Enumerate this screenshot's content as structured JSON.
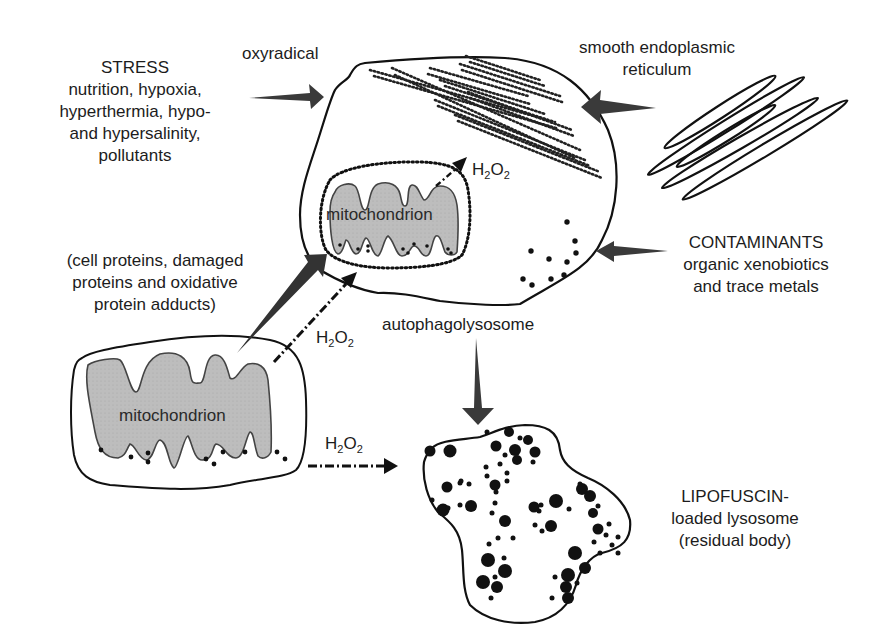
{
  "labels": {
    "stress": {
      "title": "STRESS",
      "lines": [
        "nutrition, hypoxia,",
        "hyperthermia, hypo-",
        "and hypersalinity,",
        "pollutants"
      ]
    },
    "oxyradical": "oxyradical",
    "ser": {
      "lines": [
        "smooth endoplasmic",
        "reticulum"
      ]
    },
    "contaminants": {
      "title": "CONTAMINANTS",
      "lines": [
        "organic xenobiotics",
        "and trace metals"
      ]
    },
    "proteins": {
      "lines": [
        "(cell proteins, damaged",
        "proteins and oxidative",
        "protein adducts)"
      ]
    },
    "autophagolysosome": "autophagolysosome",
    "lipofuscin": {
      "lines": [
        "LIPOFUSCIN-",
        "loaded lysosome",
        "(residual body)"
      ]
    },
    "mitochondrion_inner": "mitochondrion",
    "mitochondrion_outer": "mitochondrion",
    "h2o2": {
      "main": "H",
      "sub1": "2",
      "mid": "O",
      "sub2": "2"
    }
  },
  "colors": {
    "stroke": "#111111",
    "arrow_fill": "#3a3a3a",
    "mito_fill": "#b9b9b9",
    "dot": "#111111",
    "background": "#ffffff"
  }
}
